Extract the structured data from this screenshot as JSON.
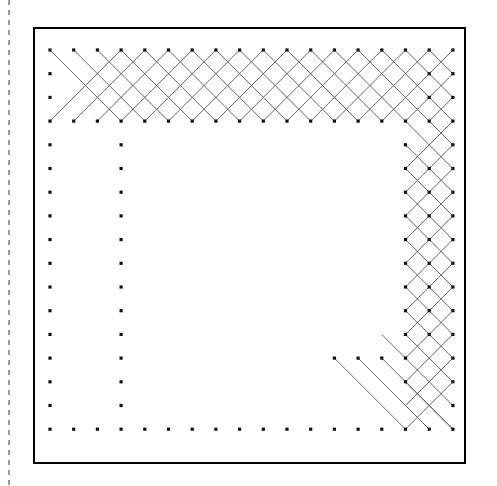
{
  "figure": {
    "canvas": {
      "width": 497,
      "height": 486,
      "background": "#ffffff"
    },
    "colors": {
      "dot": "#111111",
      "line": "#555555",
      "border": "#000000",
      "dashed_guide": "#9a9a9a",
      "background": "#ffffff"
    },
    "border_frame": {
      "name": "plot-border",
      "x": 34,
      "y": 28,
      "width": 431,
      "height": 435,
      "stroke": "#000000",
      "stroke_width": 2,
      "fill": "none"
    },
    "dashed_guide_line": {
      "name": "left-dashed-guide",
      "orientation": "vertical",
      "x": 9,
      "y1": 0,
      "y2": 486,
      "stroke": "#9a9a9a",
      "stroke_width": 2,
      "dash": "5 5"
    },
    "grid": {
      "origin_x": 50,
      "origin_y": 50,
      "step_x": 23.7,
      "step_y": 23.7,
      "cols": 18,
      "rows": 17,
      "dot_size": 3.2,
      "dot_shape": "square"
    }
  },
  "chart_data": {
    "type": "scatter",
    "xlabel": "",
    "ylabel": "",
    "grid": false,
    "legend": null,
    "xlim": [
      0,
      17
    ],
    "ylim": [
      0,
      16
    ],
    "dots": [
      {
        "row": 0,
        "cols": [
          0,
          1,
          2,
          3,
          4,
          5,
          6,
          7,
          8,
          9,
          10,
          11,
          12,
          13,
          14,
          15,
          16,
          17
        ]
      },
      {
        "row": 1,
        "cols": [
          0,
          16,
          17
        ]
      },
      {
        "row": 2,
        "cols": [
          0,
          16,
          17
        ]
      },
      {
        "row": 3,
        "cols": [
          0,
          1,
          2,
          3,
          4,
          5,
          6,
          7,
          8,
          9,
          10,
          11,
          12,
          13,
          14,
          15,
          16,
          17
        ]
      },
      {
        "row": 4,
        "cols": [
          0,
          3,
          15,
          17
        ]
      },
      {
        "row": 5,
        "cols": [
          0,
          3,
          15,
          16,
          17
        ]
      },
      {
        "row": 6,
        "cols": [
          0,
          3,
          15,
          16,
          17
        ]
      },
      {
        "row": 7,
        "cols": [
          0,
          3,
          15,
          16,
          17
        ]
      },
      {
        "row": 8,
        "cols": [
          0,
          3,
          15,
          16,
          17
        ]
      },
      {
        "row": 9,
        "cols": [
          0,
          3,
          15,
          16,
          17
        ]
      },
      {
        "row": 10,
        "cols": [
          0,
          3,
          15,
          16,
          17
        ]
      },
      {
        "row": 11,
        "cols": [
          0,
          3,
          15,
          16,
          17
        ]
      },
      {
        "row": 12,
        "cols": [
          0,
          3,
          15,
          16,
          17
        ]
      },
      {
        "row": 13,
        "cols": [
          0,
          3,
          12,
          13,
          14,
          15,
          17
        ]
      },
      {
        "row": 14,
        "cols": [
          0,
          3,
          15,
          17
        ]
      },
      {
        "row": 15,
        "cols": [
          0,
          3,
          17
        ]
      },
      {
        "row": 16,
        "cols": [
          0,
          1,
          2,
          3,
          4,
          5,
          6,
          7,
          8,
          9,
          10,
          11,
          12,
          13,
          14,
          15,
          16,
          17
        ]
      }
    ],
    "segments": [
      {
        "x1": 0,
        "y1": 0,
        "x2": 3,
        "y2": 3
      },
      {
        "x1": 1,
        "y1": 0,
        "x2": 4,
        "y2": 3
      },
      {
        "x1": 2,
        "y1": 0,
        "x2": 5,
        "y2": 3
      },
      {
        "x1": 3,
        "y1": 0,
        "x2": 6,
        "y2": 3
      },
      {
        "x1": 4,
        "y1": 0,
        "x2": 7,
        "y2": 3
      },
      {
        "x1": 5,
        "y1": 0,
        "x2": 8,
        "y2": 3
      },
      {
        "x1": 6,
        "y1": 0,
        "x2": 9,
        "y2": 3
      },
      {
        "x1": 7,
        "y1": 0,
        "x2": 10,
        "y2": 3
      },
      {
        "x1": 8,
        "y1": 0,
        "x2": 11,
        "y2": 3
      },
      {
        "x1": 9,
        "y1": 0,
        "x2": 12,
        "y2": 3
      },
      {
        "x1": 10,
        "y1": 0,
        "x2": 13,
        "y2": 3
      },
      {
        "x1": 11,
        "y1": 0,
        "x2": 14,
        "y2": 3
      },
      {
        "x1": 12,
        "y1": 0,
        "x2": 15,
        "y2": 3
      },
      {
        "x1": 13,
        "y1": 0,
        "x2": 16,
        "y2": 3
      },
      {
        "x1": 14,
        "y1": 0,
        "x2": 17,
        "y2": 3
      },
      {
        "x1": 15,
        "y1": 0,
        "x2": 17,
        "y2": 2
      },
      {
        "x1": 16,
        "y1": 0,
        "x2": 17,
        "y2": 1
      },
      {
        "x1": 3,
        "y1": 0,
        "x2": 0,
        "y2": 3
      },
      {
        "x1": 4,
        "y1": 0,
        "x2": 1,
        "y2": 3
      },
      {
        "x1": 5,
        "y1": 0,
        "x2": 2,
        "y2": 3
      },
      {
        "x1": 6,
        "y1": 0,
        "x2": 3,
        "y2": 3
      },
      {
        "x1": 7,
        "y1": 0,
        "x2": 4,
        "y2": 3
      },
      {
        "x1": 8,
        "y1": 0,
        "x2": 5,
        "y2": 3
      },
      {
        "x1": 9,
        "y1": 0,
        "x2": 6,
        "y2": 3
      },
      {
        "x1": 10,
        "y1": 0,
        "x2": 7,
        "y2": 3
      },
      {
        "x1": 11,
        "y1": 0,
        "x2": 8,
        "y2": 3
      },
      {
        "x1": 12,
        "y1": 0,
        "x2": 9,
        "y2": 3
      },
      {
        "x1": 13,
        "y1": 0,
        "x2": 10,
        "y2": 3
      },
      {
        "x1": 14,
        "y1": 0,
        "x2": 11,
        "y2": 3
      },
      {
        "x1": 15,
        "y1": 0,
        "x2": 12,
        "y2": 3
      },
      {
        "x1": 16,
        "y1": 0,
        "x2": 13,
        "y2": 3
      },
      {
        "x1": 17,
        "y1": 0,
        "x2": 14,
        "y2": 3
      },
      {
        "x1": 17,
        "y1": 1,
        "x2": 15,
        "y2": 3
      },
      {
        "x1": 17,
        "y1": 2,
        "x2": 16,
        "y2": 3
      },
      {
        "x1": 15,
        "y1": 3,
        "x2": 17,
        "y2": 5
      },
      {
        "x1": 16,
        "y1": 3,
        "x2": 17,
        "y2": 4
      },
      {
        "x1": 17,
        "y1": 3,
        "x2": 15,
        "y2": 5
      },
      {
        "x1": 17,
        "y1": 4,
        "x2": 15,
        "y2": 6
      },
      {
        "x1": 15,
        "y1": 4,
        "x2": 17,
        "y2": 6
      },
      {
        "x1": 17,
        "y1": 5,
        "x2": 15,
        "y2": 7
      },
      {
        "x1": 15,
        "y1": 5,
        "x2": 17,
        "y2": 7
      },
      {
        "x1": 17,
        "y1": 6,
        "x2": 15,
        "y2": 8
      },
      {
        "x1": 15,
        "y1": 6,
        "x2": 17,
        "y2": 8
      },
      {
        "x1": 17,
        "y1": 7,
        "x2": 15,
        "y2": 9
      },
      {
        "x1": 15,
        "y1": 7,
        "x2": 17,
        "y2": 9
      },
      {
        "x1": 17,
        "y1": 8,
        "x2": 15,
        "y2": 10
      },
      {
        "x1": 15,
        "y1": 8,
        "x2": 17,
        "y2": 10
      },
      {
        "x1": 17,
        "y1": 9,
        "x2": 15,
        "y2": 11
      },
      {
        "x1": 15,
        "y1": 9,
        "x2": 17,
        "y2": 11
      },
      {
        "x1": 17,
        "y1": 10,
        "x2": 15,
        "y2": 12
      },
      {
        "x1": 15,
        "y1": 10,
        "x2": 17,
        "y2": 12
      },
      {
        "x1": 17,
        "y1": 11,
        "x2": 15,
        "y2": 13
      },
      {
        "x1": 15,
        "y1": 11,
        "x2": 17,
        "y2": 13
      },
      {
        "x1": 17,
        "y1": 12,
        "x2": 15,
        "y2": 14
      },
      {
        "x1": 15,
        "y1": 12,
        "x2": 17,
        "y2": 14
      },
      {
        "x1": 17,
        "y1": 13,
        "x2": 15,
        "y2": 15
      },
      {
        "x1": 15,
        "y1": 13,
        "x2": 17,
        "y2": 15
      },
      {
        "x1": 12,
        "y1": 13,
        "x2": 15,
        "y2": 16
      },
      {
        "x1": 13,
        "y1": 13,
        "x2": 16,
        "y2": 16
      },
      {
        "x1": 14,
        "y1": 13,
        "x2": 17,
        "y2": 16
      },
      {
        "x1": 15,
        "y1": 13,
        "x2": 14,
        "y2": 12
      },
      {
        "x1": 15,
        "y1": 14,
        "x2": 17,
        "y2": 16
      },
      {
        "x1": 15,
        "y1": 15,
        "x2": 16,
        "y2": 16
      },
      {
        "x1": 17,
        "y1": 14,
        "x2": 15,
        "y2": 16
      }
    ]
  }
}
